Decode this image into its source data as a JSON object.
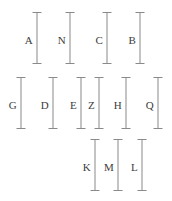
{
  "figure": {
    "width": 172,
    "height": 201,
    "background_color": "#ffffff",
    "bar_color": "#8a8a8a",
    "label_color": "#3c3c3c"
  },
  "chart_data": {
    "type": "bar",
    "title": "",
    "subtitle": "",
    "xlabel": "",
    "ylabel": "",
    "grid": false,
    "legend": null,
    "orientation": "vertical-interval-bars",
    "categories": [
      "A",
      "N",
      "C",
      "B",
      "G",
      "D",
      "E",
      "Z",
      "H",
      "Q",
      "K",
      "M",
      "L"
    ],
    "values": [
      52,
      52,
      52,
      52,
      52,
      52,
      52,
      52,
      52,
      52,
      52,
      52,
      52
    ],
    "xlim": [
      0,
      172
    ],
    "ylim": [
      0,
      201
    ],
    "rows": [
      {
        "row_index": 1,
        "bar_top_y": 12,
        "bar_bottom_y": 64,
        "label_y": 40,
        "bars": [
          {
            "label": "A",
            "x": 37,
            "top": 12,
            "bottom": 64,
            "height": 52,
            "label_x": 33
          },
          {
            "label": "N",
            "x": 70,
            "top": 12,
            "bottom": 64,
            "height": 52,
            "label_x": 66
          },
          {
            "label": "C",
            "x": 107,
            "top": 12,
            "bottom": 64,
            "height": 52,
            "label_x": 103
          },
          {
            "label": "B",
            "x": 140,
            "top": 12,
            "bottom": 64,
            "height": 52,
            "label_x": 136
          }
        ]
      },
      {
        "row_index": 2,
        "bar_top_y": 77,
        "bar_bottom_y": 129,
        "label_y": 105,
        "bars": [
          {
            "label": "G",
            "x": 21,
            "top": 77,
            "bottom": 129,
            "height": 52,
            "label_x": 17
          },
          {
            "label": "D",
            "x": 53,
            "top": 77,
            "bottom": 129,
            "height": 52,
            "label_x": 49
          },
          {
            "label": "E",
            "x": 81,
            "top": 77,
            "bottom": 129,
            "height": 52,
            "label_x": 77
          },
          {
            "label": "Z",
            "x": 99,
            "top": 77,
            "bottom": 129,
            "height": 52,
            "label_x": 95
          },
          {
            "label": "H",
            "x": 126,
            "top": 77,
            "bottom": 129,
            "height": 52,
            "label_x": 122
          },
          {
            "label": "Q",
            "x": 158,
            "top": 77,
            "bottom": 129,
            "height": 52,
            "label_x": 154
          }
        ]
      },
      {
        "row_index": 3,
        "bar_top_y": 139,
        "bar_bottom_y": 191,
        "label_y": 167,
        "bars": [
          {
            "label": "K",
            "x": 95,
            "top": 139,
            "bottom": 191,
            "height": 52,
            "label_x": 91
          },
          {
            "label": "M",
            "x": 118,
            "top": 139,
            "bottom": 191,
            "height": 52,
            "label_x": 114
          },
          {
            "label": "L",
            "x": 142,
            "top": 139,
            "bottom": 191,
            "height": 52,
            "label_x": 138
          }
        ]
      }
    ]
  }
}
